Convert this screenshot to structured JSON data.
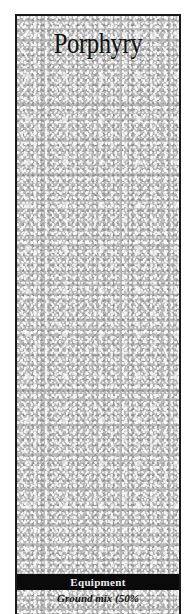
{
  "card": {
    "title": "Porphyry",
    "section_header": "Equipment",
    "description_partial": "Ground mix (50%",
    "colors": {
      "border": "#1a1a1a",
      "texture_base": "#b8b8b8",
      "band_background": "#0a0a0a",
      "band_text": "#f0f0f0",
      "title_text": "#111111"
    }
  }
}
